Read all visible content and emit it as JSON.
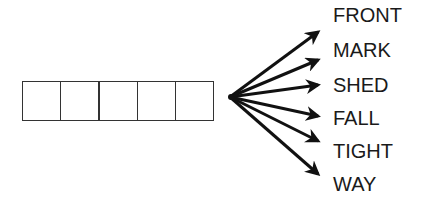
{
  "puzzle": {
    "boxes": {
      "count": 5,
      "x": 22,
      "y": 81,
      "cell_width": 38.4,
      "height": 40
    },
    "origin": {
      "x": 230,
      "y": 97
    },
    "words": [
      {
        "text": "FRONT",
        "y": 4,
        "arrow_tip": {
          "x": 320,
          "y": 31
        }
      },
      {
        "text": "MARK",
        "y": 39,
        "arrow_tip": {
          "x": 320,
          "y": 59
        }
      },
      {
        "text": "SHED",
        "y": 74,
        "arrow_tip": {
          "x": 320,
          "y": 84
        }
      },
      {
        "text": "FALL",
        "y": 107,
        "arrow_tip": {
          "x": 320,
          "y": 117
        }
      },
      {
        "text": "TIGHT",
        "y": 140,
        "arrow_tip": {
          "x": 320,
          "y": 142
        }
      },
      {
        "text": "WAY",
        "y": 173,
        "arrow_tip": {
          "x": 320,
          "y": 175
        }
      }
    ],
    "colors": {
      "arrow": "#111111",
      "box_border": "#333333",
      "text": "#1a1a1a"
    }
  }
}
